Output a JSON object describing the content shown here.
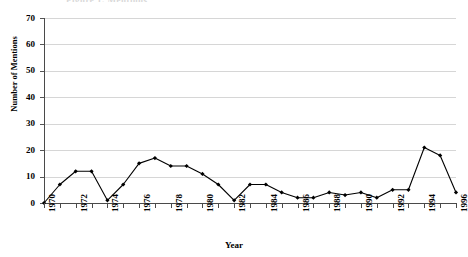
{
  "figure": {
    "title_sliver": "Figure 1. Mentions",
    "background": "#ffffff",
    "series_color": "#000000",
    "grid_color": "#d6d6d6",
    "axis_color": "#4a4a4a"
  },
  "chart_data": {
    "type": "line",
    "title": "",
    "xlabel": "Year",
    "ylabel": "Number of Mentions",
    "xlim": [
      1970,
      1996
    ],
    "ylim": [
      0,
      70
    ],
    "yticks": [
      0,
      10,
      20,
      30,
      40,
      50,
      60,
      70
    ],
    "ytick_labels": [
      "0",
      "10",
      "20",
      "30",
      "40",
      "50",
      "60",
      "70"
    ],
    "xticks": [
      1970,
      1971,
      1972,
      1973,
      1974,
      1975,
      1976,
      1977,
      1978,
      1979,
      1980,
      1981,
      1982,
      1983,
      1984,
      1985,
      1986,
      1987,
      1988,
      1989,
      1990,
      1991,
      1992,
      1993,
      1994,
      1995,
      1996
    ],
    "xtick_labels_shown": [
      "1970",
      "1972",
      "1974",
      "1976",
      "1978",
      "1980",
      "1982",
      "1984",
      "1986",
      "1988",
      "1990",
      "1992",
      "1994",
      "1996"
    ],
    "grid": "horizontal",
    "legend": "none",
    "marker": "diamond",
    "x": [
      1970,
      1971,
      1972,
      1973,
      1974,
      1975,
      1976,
      1977,
      1978,
      1979,
      1980,
      1981,
      1982,
      1983,
      1984,
      1985,
      1986,
      1987,
      1988,
      1989,
      1990,
      1991,
      1992,
      1993,
      1994,
      1995,
      1996
    ],
    "values": [
      0,
      7,
      12,
      12,
      1,
      7,
      15,
      17,
      14,
      14,
      11,
      7,
      1,
      7,
      7,
      4,
      2,
      2,
      4,
      3,
      4,
      2,
      5,
      5,
      21,
      18,
      4
    ],
    "series": [
      {
        "name": "Number of Mentions",
        "values": [
          0,
          7,
          12,
          12,
          1,
          7,
          15,
          17,
          14,
          14,
          11,
          7,
          1,
          7,
          7,
          4,
          2,
          2,
          4,
          3,
          4,
          2,
          5,
          5,
          21,
          18,
          4
        ]
      }
    ]
  }
}
